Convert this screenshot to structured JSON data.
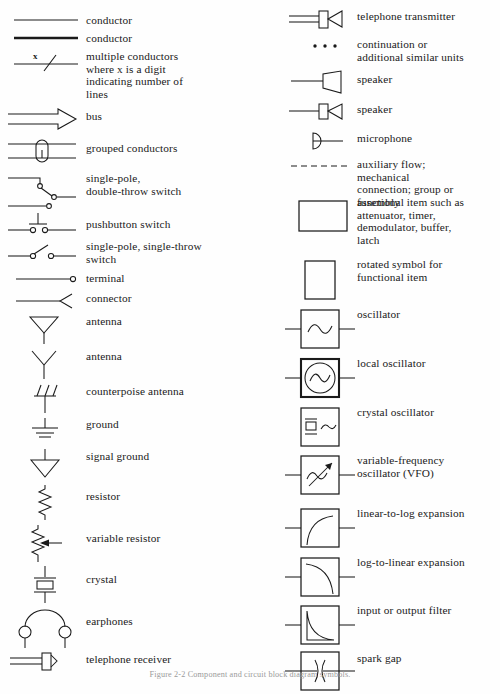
{
  "caption": "Figure 2-2   Component and circuit block diagram symbols.",
  "left_column": [
    {
      "symbol": "conductor-line",
      "label": "conductor"
    },
    {
      "symbol": "conductor-heavy-line",
      "label": "conductor"
    },
    {
      "symbol": "multiple-conductors-slash",
      "label": "multiple conductors\n   where x is a digit\n   indicating number of\n   lines",
      "annotation": "x"
    },
    {
      "symbol": "bus-arrow",
      "label": "bus"
    },
    {
      "symbol": "grouped-conductors",
      "label": "grouped conductors"
    },
    {
      "symbol": "single-pole-double-throw-switch",
      "label": "single-pole,\n   double-throw switch"
    },
    {
      "symbol": "pushbutton-switch",
      "label": "pushbutton switch"
    },
    {
      "symbol": "single-pole-single-throw-switch",
      "label": "single-pole, single-throw\n   switch"
    },
    {
      "symbol": "terminal",
      "label": "terminal"
    },
    {
      "symbol": "connector",
      "label": "connector"
    },
    {
      "symbol": "antenna-triangle",
      "label": "antenna"
    },
    {
      "symbol": "antenna-dipole",
      "label": "antenna"
    },
    {
      "symbol": "counterpoise-antenna",
      "label": "counterpoise antenna"
    },
    {
      "symbol": "ground",
      "label": "ground"
    },
    {
      "symbol": "signal-ground",
      "label": "signal ground"
    },
    {
      "symbol": "resistor",
      "label": "resistor"
    },
    {
      "symbol": "variable-resistor",
      "label": "variable resistor"
    },
    {
      "symbol": "crystal",
      "label": "crystal"
    },
    {
      "symbol": "earphones",
      "label": "earphones"
    },
    {
      "symbol": "telephone-receiver",
      "label": "telephone receiver"
    }
  ],
  "right_column": [
    {
      "symbol": "telephone-transmitter",
      "label": "telephone transmitter"
    },
    {
      "symbol": "continuation-dots",
      "label": "continuation or\n   additional similar units"
    },
    {
      "symbol": "speaker-horn",
      "label": "speaker"
    },
    {
      "symbol": "speaker-boxed",
      "label": "speaker"
    },
    {
      "symbol": "microphone",
      "label": "microphone"
    },
    {
      "symbol": "auxiliary-flow-dashed",
      "label": "auxiliary flow;\n   mechanical\n   connection; group or\n   assembly"
    },
    {
      "symbol": "functional-item-box",
      "label": "functional item such as\n   attenuator, timer,\n   demodulator, buffer,\n   latch"
    },
    {
      "symbol": "rotated-functional-item-box",
      "label": "rotated symbol for\n   functional item"
    },
    {
      "symbol": "oscillator",
      "label": "oscillator"
    },
    {
      "symbol": "local-oscillator",
      "label": "local oscillator"
    },
    {
      "symbol": "crystal-oscillator",
      "label": "crystal oscillator"
    },
    {
      "symbol": "variable-frequency-oscillator",
      "label": "variable-frequency\n   oscillator (VFO)"
    },
    {
      "symbol": "linear-to-log-expansion",
      "label": "linear-to-log expansion"
    },
    {
      "symbol": "log-to-linear-expansion",
      "label": "log-to-linear expansion"
    },
    {
      "symbol": "input-or-output-filter",
      "label": "input or output filter"
    },
    {
      "symbol": "spark-gap",
      "label": "spark gap"
    }
  ],
  "colors": {
    "ink": "#1a1a1a",
    "paper": "#fefefe"
  }
}
